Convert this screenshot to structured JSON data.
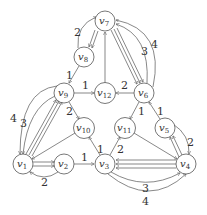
{
  "graph": {
    "nodes": [
      {
        "id": "v1",
        "name": "v",
        "sub": "1",
        "x": 23,
        "y": 164
      },
      {
        "id": "v2",
        "name": "v",
        "sub": "2",
        "x": 64,
        "y": 164
      },
      {
        "id": "v3",
        "name": "v",
        "sub": "3",
        "x": 105,
        "y": 164
      },
      {
        "id": "v4",
        "name": "v",
        "sub": "4",
        "x": 186,
        "y": 164
      },
      {
        "id": "v5",
        "name": "v",
        "sub": "5",
        "x": 165,
        "y": 128
      },
      {
        "id": "v6",
        "name": "v",
        "sub": "6",
        "x": 144,
        "y": 93
      },
      {
        "id": "v7",
        "name": "v",
        "sub": "7",
        "x": 105,
        "y": 21
      },
      {
        "id": "v8",
        "name": "v",
        "sub": "8",
        "x": 84,
        "y": 57
      },
      {
        "id": "v9",
        "name": "v",
        "sub": "9",
        "x": 64,
        "y": 93
      },
      {
        "id": "v10",
        "name": "v",
        "sub": "10",
        "x": 84,
        "y": 128
      },
      {
        "id": "v11",
        "name": "v",
        "sub": "11",
        "x": 125,
        "y": 128
      },
      {
        "id": "v12",
        "name": "v",
        "sub": "12",
        "x": 105,
        "y": 93
      }
    ],
    "edge_labels": {
      "v8_v7": "2",
      "v8_v9": "1",
      "v9_v12": "1",
      "v6_v12": "2",
      "v6_v7_a": "3",
      "v6_v7_b": "4",
      "v9_v10": "2",
      "v6_v11": "1",
      "v5_v6": "1",
      "v3_v10": "1",
      "v3_v11": "2",
      "v9_v1_a": "4",
      "v9_v1_b": "3",
      "v2_v1": "2",
      "v2_v3": "1",
      "v3_v4_a": "3",
      "v3_v4_b": "4",
      "v4_v5": "2"
    }
  }
}
